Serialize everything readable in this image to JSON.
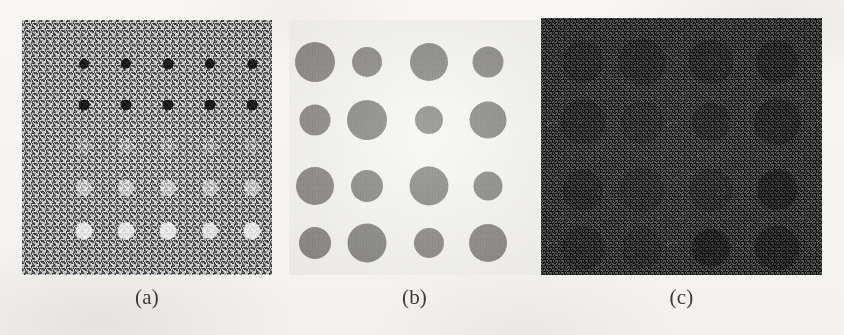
{
  "figure": {
    "panel_count": 3,
    "page_background": "#f5f4f0"
  },
  "panels": [
    {
      "id": "a",
      "caption": "(a)",
      "description": "noisy gray field with 5x5 grid of dots of graded contrast",
      "frame": {
        "x": 22,
        "y": 20,
        "w": 250,
        "h": 255
      },
      "caption_pos": {
        "x": 22,
        "y": 287,
        "w": 250
      },
      "background_color": "#8d8d8d",
      "noise": "heavy",
      "grid": {
        "rows": 5,
        "cols": 5
      },
      "col_x": [
        62,
        104,
        146,
        188,
        230
      ],
      "row_y": [
        44,
        85,
        126,
        168,
        211
      ],
      "dots": [
        {
          "row": 0,
          "col": 0,
          "r": 5.0,
          "color": "#121212",
          "opacity": 1.0
        },
        {
          "row": 0,
          "col": 1,
          "r": 5.2,
          "color": "#121212",
          "opacity": 1.0
        },
        {
          "row": 0,
          "col": 2,
          "r": 5.4,
          "color": "#141414",
          "opacity": 1.0
        },
        {
          "row": 0,
          "col": 3,
          "r": 5.2,
          "color": "#121212",
          "opacity": 1.0
        },
        {
          "row": 0,
          "col": 4,
          "r": 4.8,
          "color": "#151515",
          "opacity": 1.0
        },
        {
          "row": 1,
          "col": 0,
          "r": 5.4,
          "color": "#101010",
          "opacity": 1.0
        },
        {
          "row": 1,
          "col": 1,
          "r": 5.6,
          "color": "#101010",
          "opacity": 1.0
        },
        {
          "row": 1,
          "col": 2,
          "r": 5.6,
          "color": "#111111",
          "opacity": 1.0
        },
        {
          "row": 1,
          "col": 3,
          "r": 5.6,
          "color": "#101010",
          "opacity": 1.0
        },
        {
          "row": 1,
          "col": 4,
          "r": 5.4,
          "color": "#121212",
          "opacity": 1.0
        },
        {
          "row": 2,
          "col": 0,
          "r": 7.5,
          "color": "#b9b9b9",
          "opacity": 0.5
        },
        {
          "row": 2,
          "col": 1,
          "r": 7.5,
          "color": "#bdbdbd",
          "opacity": 0.5
        },
        {
          "row": 2,
          "col": 2,
          "r": 7.5,
          "color": "#bababa",
          "opacity": 0.48
        },
        {
          "row": 2,
          "col": 3,
          "r": 7.5,
          "color": "#bcbcbc",
          "opacity": 0.48
        },
        {
          "row": 2,
          "col": 4,
          "r": 7.5,
          "color": "#b8b8b8",
          "opacity": 0.46
        },
        {
          "row": 3,
          "col": 0,
          "r": 8.0,
          "color": "#d8d8d8",
          "opacity": 0.75
        },
        {
          "row": 3,
          "col": 1,
          "r": 8.0,
          "color": "#dcdcdc",
          "opacity": 0.78
        },
        {
          "row": 3,
          "col": 2,
          "r": 8.0,
          "color": "#dadada",
          "opacity": 0.76
        },
        {
          "row": 3,
          "col": 3,
          "r": 8.0,
          "color": "#d7d7d7",
          "opacity": 0.74
        },
        {
          "row": 3,
          "col": 4,
          "r": 8.0,
          "color": "#dbdbdb",
          "opacity": 0.76
        },
        {
          "row": 4,
          "col": 0,
          "r": 8.5,
          "color": "#efefef",
          "opacity": 0.96
        },
        {
          "row": 4,
          "col": 1,
          "r": 8.5,
          "color": "#eeeeee",
          "opacity": 0.94
        },
        {
          "row": 4,
          "col": 2,
          "r": 8.5,
          "color": "#f0f0f0",
          "opacity": 0.96
        },
        {
          "row": 4,
          "col": 3,
          "r": 8.2,
          "color": "#ededed",
          "opacity": 0.92
        },
        {
          "row": 4,
          "col": 4,
          "r": 8.5,
          "color": "#f1f1f1",
          "opacity": 0.96
        }
      ]
    },
    {
      "id": "b",
      "caption": "(b)",
      "description": "clean white field with 4x4 grid of dark disks of varying radius",
      "frame": {
        "x": 289,
        "y": 20,
        "w": 251,
        "h": 255
      },
      "caption_pos": {
        "x": 289,
        "y": 287,
        "w": 251
      },
      "background_color": "#f0efec",
      "noise": "none",
      "grid": {
        "rows": 4,
        "cols": 4
      },
      "col_x": [
        26,
        78,
        140,
        199
      ],
      "row_y": [
        42,
        100,
        166,
        223
      ],
      "dots": [
        {
          "row": 0,
          "col": 0,
          "r": 20.0,
          "color": "#2a2927",
          "opacity": 1.0
        },
        {
          "row": 0,
          "col": 1,
          "r": 15.0,
          "color": "#2b2a28",
          "opacity": 1.0
        },
        {
          "row": 0,
          "col": 2,
          "r": 19.0,
          "color": "#2a2927",
          "opacity": 1.0
        },
        {
          "row": 0,
          "col": 3,
          "r": 15.5,
          "color": "#2c2b29",
          "opacity": 1.0
        },
        {
          "row": 1,
          "col": 0,
          "r": 15.5,
          "color": "#2b2a28",
          "opacity": 1.0
        },
        {
          "row": 1,
          "col": 1,
          "r": 20.0,
          "color": "#292826",
          "opacity": 1.0
        },
        {
          "row": 1,
          "col": 2,
          "r": 14.0,
          "color": "#2c2b29",
          "opacity": 1.0
        },
        {
          "row": 1,
          "col": 3,
          "r": 18.5,
          "color": "#2a2927",
          "opacity": 1.0
        },
        {
          "row": 2,
          "col": 0,
          "r": 19.0,
          "color": "#2a2927",
          "opacity": 1.0
        },
        {
          "row": 2,
          "col": 1,
          "r": 16.0,
          "color": "#2b2a28",
          "opacity": 1.0
        },
        {
          "row": 2,
          "col": 2,
          "r": 19.5,
          "color": "#2a2927",
          "opacity": 1.0
        },
        {
          "row": 2,
          "col": 3,
          "r": 14.5,
          "color": "#2c2b29",
          "opacity": 1.0
        },
        {
          "row": 3,
          "col": 0,
          "r": 16.0,
          "color": "#2b2a28",
          "opacity": 1.0
        },
        {
          "row": 3,
          "col": 1,
          "r": 19.5,
          "color": "#292826",
          "opacity": 1.0
        },
        {
          "row": 3,
          "col": 2,
          "r": 15.0,
          "color": "#2c2b29",
          "opacity": 1.0
        },
        {
          "row": 3,
          "col": 3,
          "r": 19.0,
          "color": "#2a2927",
          "opacity": 1.0
        }
      ]
    },
    {
      "id": "c",
      "caption": "(c)",
      "description": "dark heavily-noised field with the same 4x4 disks barely above the noise floor",
      "frame": {
        "x": 541,
        "y": 18,
        "w": 281,
        "h": 257
      },
      "caption_pos": {
        "x": 541,
        "y": 287,
        "w": 281
      },
      "background_color": "#3a3a3a",
      "noise": "very heavy",
      "grid": {
        "rows": 4,
        "cols": 4
      },
      "col_x": [
        42,
        101,
        170,
        236
      ],
      "row_y": [
        44,
        104,
        172,
        230
      ],
      "dots": [
        {
          "row": 0,
          "col": 0,
          "r": 20.0,
          "color": "#2e2e2e",
          "opacity": 0.85
        },
        {
          "row": 0,
          "col": 1,
          "r": 23.0,
          "color": "#2d2d2d",
          "opacity": 0.85
        },
        {
          "row": 0,
          "col": 2,
          "r": 22.0,
          "color": "#2c2c2c",
          "opacity": 0.88
        },
        {
          "row": 0,
          "col": 3,
          "r": 21.0,
          "color": "#292929",
          "opacity": 0.9
        },
        {
          "row": 1,
          "col": 0,
          "r": 22.0,
          "color": "#2d2d2d",
          "opacity": 0.86
        },
        {
          "row": 1,
          "col": 1,
          "r": 21.0,
          "color": "#303030",
          "opacity": 0.8
        },
        {
          "row": 1,
          "col": 2,
          "r": 19.0,
          "color": "#2b2b2b",
          "opacity": 0.88
        },
        {
          "row": 1,
          "col": 3,
          "r": 23.0,
          "color": "#292929",
          "opacity": 0.9
        },
        {
          "row": 2,
          "col": 0,
          "r": 20.0,
          "color": "#2c2c2c",
          "opacity": 0.88
        },
        {
          "row": 2,
          "col": 1,
          "r": 22.0,
          "color": "#303030",
          "opacity": 0.8
        },
        {
          "row": 2,
          "col": 2,
          "r": 21.0,
          "color": "#2e2e2e",
          "opacity": 0.84
        },
        {
          "row": 2,
          "col": 3,
          "r": 20.0,
          "color": "#242424",
          "opacity": 0.95
        },
        {
          "row": 3,
          "col": 0,
          "r": 21.0,
          "color": "#2d2d2d",
          "opacity": 0.86
        },
        {
          "row": 3,
          "col": 1,
          "r": 20.0,
          "color": "#2f2f2f",
          "opacity": 0.82
        },
        {
          "row": 3,
          "col": 2,
          "r": 19.0,
          "color": "#232323",
          "opacity": 0.95
        },
        {
          "row": 3,
          "col": 3,
          "r": 22.0,
          "color": "#262626",
          "opacity": 0.92
        }
      ]
    }
  ]
}
